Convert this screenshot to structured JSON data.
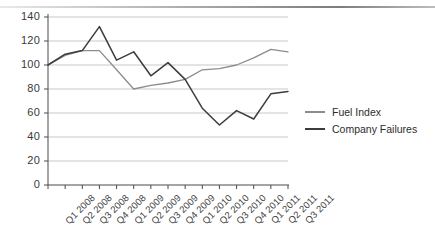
{
  "chart_data": {
    "type": "line",
    "title": "",
    "xlabel": "",
    "ylabel": "",
    "ylim": [
      0,
      140
    ],
    "ytick_step": 20,
    "grid": true,
    "legend_position": "right",
    "yticks": [
      "0",
      "20",
      "40",
      "60",
      "80",
      "100",
      "120",
      "140"
    ],
    "categories": [
      "Q1 2008",
      "Q2 2008",
      "Q3 2008",
      "Q4 2008",
      "Q1 2009",
      "Q2 2009",
      "Q3 2009",
      "Q4 2009",
      "Q1 2010",
      "Q2 2010",
      "Q3 2010",
      "Q4 2010",
      "Q1 2011",
      "Q2 2011",
      "Q3 2011"
    ],
    "series": [
      {
        "name": "Fuel Index",
        "color": "#8c8c8c",
        "values": [
          100,
          108,
          112,
          112,
          96,
          80,
          83,
          85,
          88,
          96,
          97,
          100,
          106,
          113,
          111
        ]
      },
      {
        "name": "Company Failures",
        "color": "#3c3c3c",
        "values": [
          100,
          109,
          112,
          132,
          104,
          111,
          91,
          102,
          88,
          64,
          50,
          62,
          55,
          76,
          78
        ]
      }
    ]
  },
  "legend": {
    "items": [
      {
        "label": "Fuel Index",
        "color": "#8c8c8c"
      },
      {
        "label": "Company Failures",
        "color": "#3c3c3c"
      }
    ]
  },
  "colors": {
    "grid": "#c9c9c9",
    "axis": "#4a4a4a",
    "background": "#ffffff",
    "fuel_index": "#8c8c8c",
    "company_failures": "#3c3c3c"
  }
}
